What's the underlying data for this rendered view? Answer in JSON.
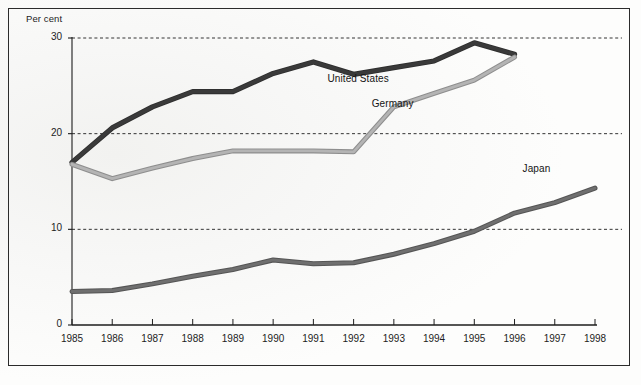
{
  "figure": {
    "y_axis_title": "Per cent",
    "background_color": "#f7f7f6",
    "frame_color": "#2b2b2b"
  },
  "chart_data": {
    "type": "line",
    "title": "",
    "subtitle": "",
    "xlabel": "",
    "ylabel": "Per cent",
    "x": [
      1985,
      1986,
      1987,
      1988,
      1989,
      1990,
      1991,
      1992,
      1993,
      1994,
      1995,
      1996,
      1997,
      1998
    ],
    "categories": [
      "1985",
      "1986",
      "1987",
      "1988",
      "1989",
      "1990",
      "1991",
      "1992",
      "1993",
      "1994",
      "1995",
      "1996",
      "1997",
      "1998"
    ],
    "xlim": [
      1985,
      1998
    ],
    "ylim": [
      0,
      30
    ],
    "yticks": [
      0,
      10,
      20,
      30
    ],
    "ytick_labels": [
      "0",
      "10",
      "20",
      "30"
    ],
    "grid": true,
    "grid_style": "dashed",
    "grid_values": [
      10,
      20,
      30
    ],
    "legend": "inline-labels",
    "series": [
      {
        "name": "United States",
        "color": "#3a3a3a",
        "label_x": 1991.35,
        "label_y": 25.6,
        "values": [
          17.0,
          20.6,
          22.8,
          24.4,
          24.4,
          26.3,
          27.5,
          26.2,
          26.9,
          27.6,
          29.5,
          28.3,
          null,
          null
        ]
      },
      {
        "name": "Germany",
        "color": "#b4b4b4",
        "label_x": 1992.45,
        "label_y": 23.0,
        "values": [
          16.8,
          15.3,
          16.4,
          17.4,
          18.2,
          18.2,
          18.2,
          18.1,
          22.8,
          24.2,
          25.6,
          28.0,
          null,
          null
        ]
      },
      {
        "name": "Japan",
        "color": "#6f6f6f",
        "label_x": 1996.2,
        "label_y": 16.2,
        "values": [
          3.5,
          3.6,
          4.3,
          5.1,
          5.8,
          6.8,
          6.4,
          6.5,
          7.4,
          8.5,
          9.8,
          11.7,
          12.8,
          14.3
        ]
      }
    ]
  }
}
